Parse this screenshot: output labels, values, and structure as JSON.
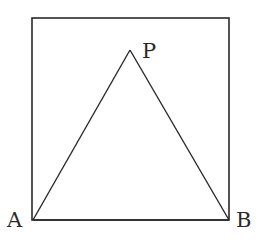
{
  "diagram": {
    "type": "geometry",
    "stroke_color": "#2a2a2a",
    "background": "#ffffff",
    "square": {
      "x": 32,
      "y": 18,
      "width": 197,
      "height": 202
    },
    "points": {
      "A": {
        "label": "A",
        "x": 33,
        "y": 220,
        "label_x": 7,
        "label_y": 227
      },
      "B": {
        "label": "B",
        "x": 229,
        "y": 220,
        "label_x": 236,
        "label_y": 227
      },
      "P": {
        "label": "P",
        "x": 130,
        "y": 50,
        "label_x": 142,
        "label_y": 58
      }
    },
    "segments": [
      {
        "from": "A",
        "to": "P"
      },
      {
        "from": "P",
        "to": "B"
      },
      {
        "from": "A",
        "to": "B"
      }
    ]
  }
}
